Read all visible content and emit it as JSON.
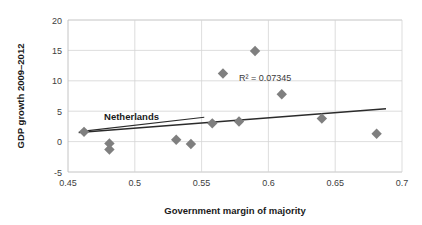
{
  "chart_data": {
    "type": "scatter",
    "title": "",
    "xlabel": "Government margin of majority",
    "ylabel": "GDP growth 2009–2012",
    "xlim": [
      0.45,
      0.7
    ],
    "ylim": [
      -5,
      20
    ],
    "xticks": [
      0.45,
      0.5,
      0.55,
      0.6,
      0.65,
      0.7
    ],
    "xtick_labels": [
      "0.45",
      "0.5",
      "0.55",
      "0.6",
      "0.65",
      "0.7"
    ],
    "yticks": [
      -5,
      0,
      5,
      10,
      15,
      20
    ],
    "ytick_labels": [
      "-5",
      "0",
      "5",
      "10",
      "15",
      "20"
    ],
    "grid": "horizontal-and-vertical",
    "legend": "none",
    "marker": "diamond",
    "marker_color": "#7f7f7f",
    "points": [
      {
        "x": 0.462,
        "y": 1.6,
        "label": "Netherlands"
      },
      {
        "x": 0.481,
        "y": -0.3,
        "label": ""
      },
      {
        "x": 0.481,
        "y": -1.3,
        "label": ""
      },
      {
        "x": 0.531,
        "y": 0.3,
        "label": ""
      },
      {
        "x": 0.542,
        "y": -0.4,
        "label": ""
      },
      {
        "x": 0.558,
        "y": 3.0,
        "label": ""
      },
      {
        "x": 0.566,
        "y": 11.2,
        "label": ""
      },
      {
        "x": 0.578,
        "y": 3.3,
        "label": ""
      },
      {
        "x": 0.59,
        "y": 14.9,
        "label": ""
      },
      {
        "x": 0.61,
        "y": 7.8,
        "label": ""
      },
      {
        "x": 0.64,
        "y": 3.8,
        "label": ""
      },
      {
        "x": 0.681,
        "y": 1.3,
        "label": ""
      }
    ],
    "trendline": {
      "x0": 0.458,
      "y0": 1.5,
      "x1": 0.688,
      "y1": 5.4
    },
    "annotations": [
      {
        "name": "r-squared",
        "text": "R² = 0.07345",
        "x": 0.578,
        "y": 10.0
      },
      {
        "name": "netherlands-callout",
        "text": "Netherlands",
        "x": 0.477,
        "y": 3.6
      }
    ]
  }
}
